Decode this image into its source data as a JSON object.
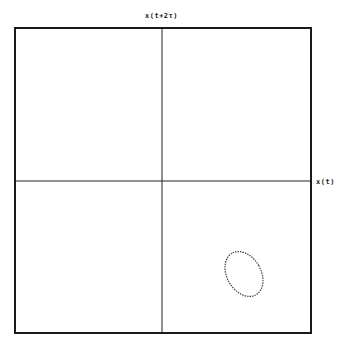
{
  "plot": {
    "y_axis_label": "x(t+2τ)",
    "x_axis_label": "x(t)",
    "frame": {
      "left": 15,
      "top": 28,
      "right": 311,
      "bottom": 333
    },
    "origin": {
      "x": 162,
      "y": 181
    },
    "line_color": "#1a1a1a",
    "trace_color": "#444444"
  },
  "trajectory": {
    "shape": "closed-loop",
    "center": {
      "x": 244,
      "y": 274
    },
    "rx": 17,
    "ry": 24,
    "rotation_deg": -30
  }
}
